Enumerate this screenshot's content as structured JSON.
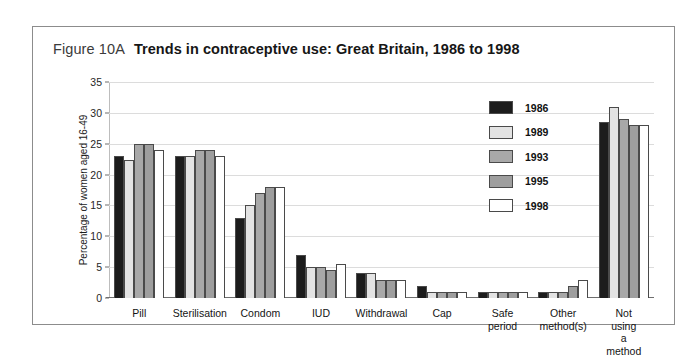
{
  "figure": {
    "number": "Figure 10A",
    "title": "Trends in contraceptive use: Great Britain, 1986 to 1998"
  },
  "chart_data": {
    "type": "bar",
    "title": "Trends in contraceptive use: Great Britain, 1986 to 1998",
    "xlabel": "",
    "ylabel": "Percentage of women aged 16-49",
    "ylim": [
      0,
      35
    ],
    "yticks": [
      0,
      5,
      10,
      15,
      20,
      25,
      30,
      35
    ],
    "grid": true,
    "legend_position": "upper-right-inside",
    "categories": [
      "Pill",
      "Sterilisation",
      "Condom",
      "IUD",
      "Withdrawal",
      "Cap",
      "Safe period",
      "Other\nmethod(s)",
      "Not using\na method"
    ],
    "series": [
      {
        "name": "1986",
        "color": "#1c1c1c",
        "values": [
          23,
          23,
          13,
          7,
          4,
          2,
          1,
          1,
          28.5
        ]
      },
      {
        "name": "1989",
        "color": "#e3e3e3",
        "values": [
          22.3,
          23,
          15,
          5,
          4,
          1,
          1,
          1,
          31
        ]
      },
      {
        "name": "1993",
        "color": "#a8a8a8",
        "values": [
          25,
          24,
          17,
          5,
          3,
          1,
          1,
          1,
          29
        ]
      },
      {
        "name": "1995",
        "color": "#9e9e9e",
        "values": [
          25,
          24,
          18,
          4.5,
          3,
          1,
          1,
          2,
          28
        ]
      },
      {
        "name": "1998",
        "color": "#ffffff",
        "values": [
          24,
          23,
          18,
          5.5,
          3,
          1,
          1,
          3,
          28
        ]
      }
    ]
  }
}
